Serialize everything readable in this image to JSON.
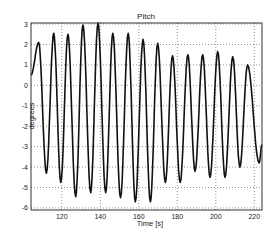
{
  "chart_data": {
    "type": "line",
    "title": "Pitch",
    "xlabel": "Time [s]",
    "ylabel": "degrees",
    "xlim": [
      104,
      224
    ],
    "ylim": [
      -6.1,
      3.05
    ],
    "grid": true,
    "grid_style": "dotted",
    "legend": null,
    "x_ticks": [
      120,
      140,
      160,
      180,
      200,
      220
    ],
    "y_ticks": [
      -6,
      -5,
      -4,
      -3,
      -2,
      -1,
      0,
      1,
      2,
      3
    ],
    "series": [
      {
        "name": "Pitch",
        "color": "#111111",
        "description": "oscillating pitch signal, period ~7.8 s",
        "peaks": [
          {
            "t": 108.0,
            "v": 2.1
          },
          {
            "t": 115.8,
            "v": 2.55
          },
          {
            "t": 123.2,
            "v": 2.5
          },
          {
            "t": 131.0,
            "v": 2.95
          },
          {
            "t": 138.8,
            "v": 3.05
          },
          {
            "t": 146.5,
            "v": 2.55
          },
          {
            "t": 154.5,
            "v": 2.55
          },
          {
            "t": 162.2,
            "v": 2.25
          },
          {
            "t": 169.8,
            "v": 2.05
          },
          {
            "t": 177.5,
            "v": 1.45
          },
          {
            "t": 185.5,
            "v": 1.5
          },
          {
            "t": 193.2,
            "v": 1.5
          },
          {
            "t": 201.0,
            "v": 1.65
          },
          {
            "t": 208.8,
            "v": 1.4
          },
          {
            "t": 216.5,
            "v": 1.0
          }
        ],
        "troughs": [
          {
            "t": 112.0,
            "v": -4.3
          },
          {
            "t": 119.5,
            "v": -4.75
          },
          {
            "t": 127.2,
            "v": -5.45
          },
          {
            "t": 135.0,
            "v": -5.25
          },
          {
            "t": 142.8,
            "v": -5.25
          },
          {
            "t": 150.5,
            "v": -5.5
          },
          {
            "t": 158.2,
            "v": -5.7
          },
          {
            "t": 166.0,
            "v": -5.7
          },
          {
            "t": 173.8,
            "v": -4.75
          },
          {
            "t": 181.5,
            "v": -4.75
          },
          {
            "t": 189.2,
            "v": -4.2
          },
          {
            "t": 197.0,
            "v": -4.5
          },
          {
            "t": 204.8,
            "v": -4.5
          },
          {
            "t": 212.5,
            "v": -4.0
          },
          {
            "t": 222.5,
            "v": -3.8
          }
        ]
      }
    ]
  },
  "labels": {
    "title": "Pitch",
    "xlabel": "Time [s]",
    "ylabel": "degrees"
  }
}
